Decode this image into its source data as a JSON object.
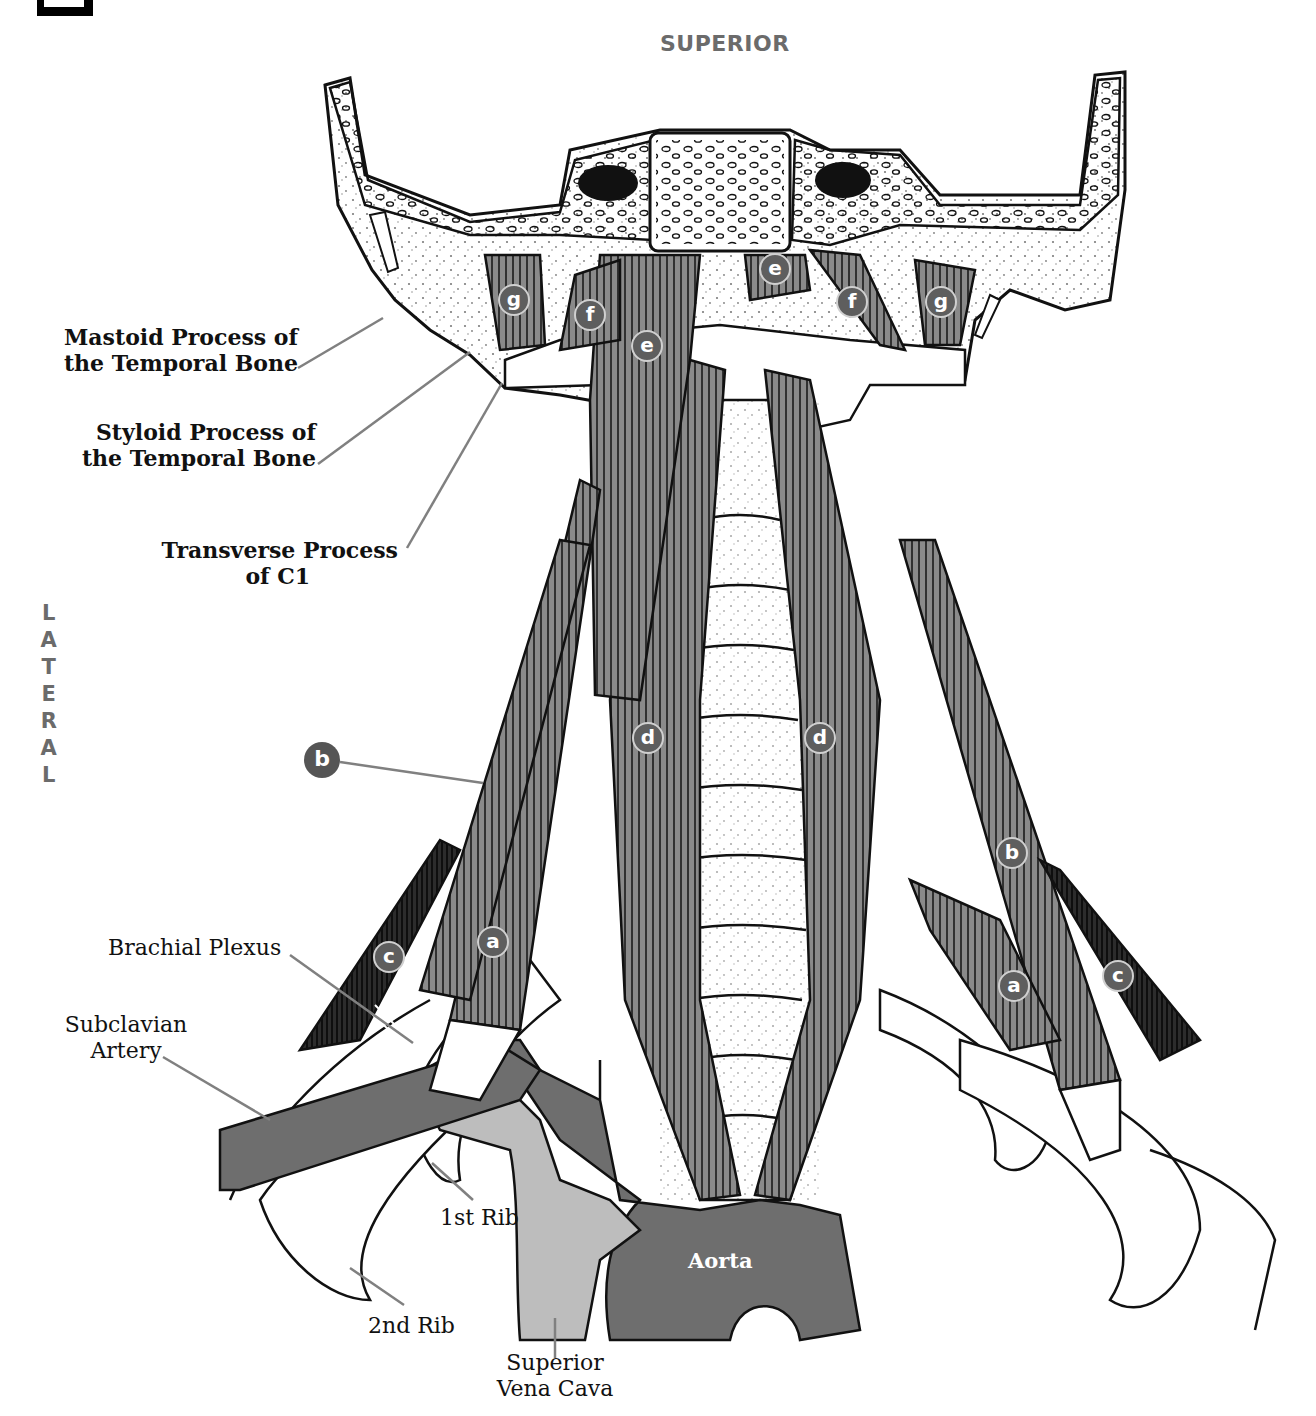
{
  "orientation": {
    "top": "SUPERIOR",
    "side": "LATERAL"
  },
  "colors": {
    "muscle_mid": "#8a8a8a",
    "muscle_dark": "#2a2a2a",
    "artery": "#6e6e6e",
    "vein": "#bdbdbd",
    "marker_fill": "#5e5e5e",
    "label_gray": "#6b6b6b",
    "leader_line": "#808080"
  },
  "bone_labels": {
    "mastoid": "Mastoid Process of the Temporal Bone",
    "styloid": "Styloid Process of the Temporal Bone",
    "transverse_c1_line1": "Transverse Process",
    "transverse_c1_line2": "of C1"
  },
  "structure_labels": {
    "brachial_plexus": "Brachial Plexus",
    "subclavian_artery_line1": "Subclavian",
    "subclavian_artery_line2": "Artery",
    "first_rib": "1st Rib",
    "second_rib": "2nd Rib",
    "svc_line1": "Superior",
    "svc_line2": "Vena Cava",
    "aorta": "Aorta"
  },
  "markers": [
    {
      "letter": "g",
      "x": 514,
      "y": 300
    },
    {
      "letter": "f",
      "x": 590,
      "y": 315
    },
    {
      "letter": "e",
      "x": 647,
      "y": 346
    },
    {
      "letter": "e",
      "x": 775,
      "y": 269
    },
    {
      "letter": "f",
      "x": 852,
      "y": 302
    },
    {
      "letter": "g",
      "x": 941,
      "y": 302
    },
    {
      "letter": "d",
      "x": 648,
      "y": 738
    },
    {
      "letter": "d",
      "x": 820,
      "y": 738
    },
    {
      "letter": "b",
      "x": 1012,
      "y": 853
    },
    {
      "letter": "a",
      "x": 493,
      "y": 942
    },
    {
      "letter": "c",
      "x": 389,
      "y": 957
    },
    {
      "letter": "a",
      "x": 1014,
      "y": 986
    },
    {
      "letter": "c",
      "x": 1118,
      "y": 976
    }
  ],
  "callout_marker": {
    "letter": "b",
    "x": 322,
    "y": 760
  }
}
